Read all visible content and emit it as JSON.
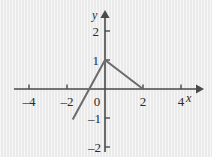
{
  "chart_data": {
    "type": "line",
    "title": "",
    "xlabel": "x",
    "ylabel": "y",
    "xlim": [
      -5.0,
      5.2
    ],
    "ylim": [
      -2.6,
      2.5
    ],
    "grid": false,
    "legend": null,
    "x_ticks": [
      -4,
      -2,
      0,
      2,
      4
    ],
    "x_tick_labels": [
      "–4",
      "–2",
      "0",
      "2",
      "4"
    ],
    "y_ticks": [
      -2,
      -1,
      1,
      2
    ],
    "y_tick_labels": [
      "–2",
      "–1",
      "1",
      "2"
    ],
    "origin_label": "0",
    "axis_arrows": [
      "x-positive",
      "y-positive"
    ],
    "series": [
      {
        "name": "piecewise-linear",
        "points": [
          {
            "x": -1.7,
            "y": -1.05
          },
          {
            "x": 0,
            "y": 1
          },
          {
            "x": 2,
            "y": 0
          }
        ]
      }
    ],
    "annotations": [
      {
        "text": "vertex",
        "x": 0,
        "y": 1
      },
      {
        "text": "x-intercept-left",
        "x": -0.85,
        "y": 0
      },
      {
        "text": "x-intercept-right",
        "x": 2,
        "y": 0
      }
    ],
    "colors": {
      "background": "#ededed",
      "axis": "#4a4a4a",
      "curve": "#6b6b6b",
      "text": "#2b2b2b"
    }
  },
  "geometry": {
    "origin_px": {
      "x": 105,
      "y": 89
    },
    "unit_px": {
      "x": 19,
      "y": 29
    }
  },
  "labels": {
    "x_axis_name": "x",
    "y_axis_name": "y",
    "x": {
      "m4": "–4",
      "m2": "–2",
      "zero": "0",
      "p2": "2",
      "p4": "4"
    },
    "y": {
      "p2": "2",
      "p1": "1",
      "m1": "–1",
      "m2": "–2"
    }
  }
}
